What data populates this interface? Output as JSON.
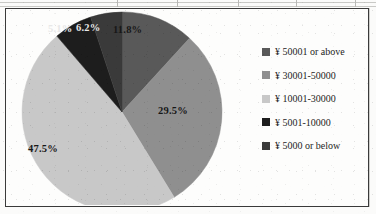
{
  "chart_data": {
    "type": "pie",
    "title": "",
    "categories": [
      "¥ 50001 or above",
      "¥ 30001-50000",
      "¥ 10001-30000",
      "¥ 5001-10000",
      "¥ 5000 or below"
    ],
    "values": [
      11.8,
      29.5,
      47.5,
      6.2,
      5.1
    ],
    "value_labels": [
      "11.8%",
      "29.5%",
      "47.5%",
      "6.2%",
      "5.1%"
    ],
    "colors": [
      "#595959",
      "#8f8f8f",
      "#c8c8c8",
      "#1d1d1d",
      "#3a3a3a"
    ],
    "units": "percent",
    "start_angle_deg": 0,
    "direction": "clockwise",
    "legend_position": "right",
    "grid": false,
    "xlabel": "",
    "ylabel": ""
  },
  "legend": {
    "items": [
      {
        "label": "¥ 50001 or above",
        "color": "#595959"
      },
      {
        "label": "¥ 30001-50000",
        "color": "#8f8f8f"
      },
      {
        "label": "¥ 10001-30000",
        "color": "#c8c8c8"
      },
      {
        "label": "¥ 5001-10000",
        "color": "#1d1d1d"
      },
      {
        "label": "¥ 5000 or below",
        "color": "#3a3a3a"
      }
    ]
  },
  "slice_labels": [
    {
      "text": "11.8%",
      "x": 113,
      "y": 24,
      "tone": "dark"
    },
    {
      "text": "29.5%",
      "x": 158,
      "y": 105,
      "tone": "dark"
    },
    {
      "text": "47.5%",
      "x": 28,
      "y": 143,
      "tone": "dark"
    },
    {
      "text": "6.2%",
      "x": 76,
      "y": 22,
      "tone": "light"
    },
    {
      "text": "5.1%",
      "x": 48,
      "y": 23,
      "tone": "light"
    }
  ]
}
